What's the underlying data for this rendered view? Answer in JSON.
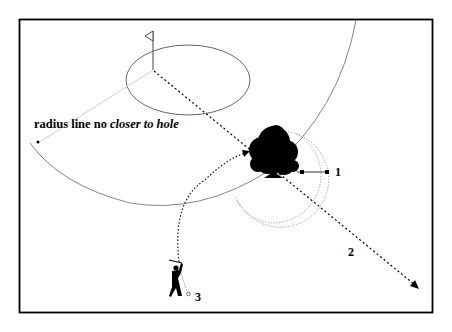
{
  "diagram": {
    "caption": {
      "normal": "radius line no ",
      "italic": "closer to hole"
    },
    "labels": {
      "option1": "1",
      "option2": "2",
      "option3": "3"
    },
    "elements": {
      "flag": "flag-icon",
      "green": "putting-green",
      "tree": "tree-icon",
      "golfer": "golfer-icon",
      "ball": "golf-ball"
    },
    "colors": {
      "frame": "#000000",
      "arc": "#777777",
      "radius_line": "#cccccc",
      "dotted": "#000000",
      "dotted_circle": "#999999"
    }
  }
}
